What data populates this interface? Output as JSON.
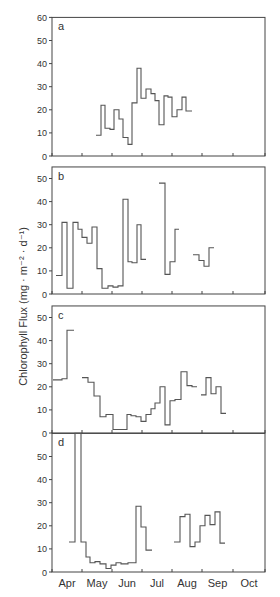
{
  "chart_data": {
    "type": "line",
    "ylabel": "Chlorophyll Flux (mg · m⁻² · d⁻¹)",
    "xlabel": "",
    "x_tick_labels": [
      "Apr",
      "May",
      "Jun",
      "Jul",
      "Aug",
      "Sep",
      "Oct"
    ],
    "x_range_months": [
      "Apr",
      "Oct"
    ],
    "style": "step",
    "panels": [
      {
        "label": "a",
        "ylim": [
          0,
          60
        ],
        "yticks": [
          0,
          10,
          20,
          30,
          40,
          50,
          60
        ],
        "segments": [
          [
            96,
            101,
            9
          ],
          [
            101,
            105,
            22
          ],
          [
            105,
            110,
            12
          ],
          [
            110,
            114,
            11.5
          ],
          [
            114,
            119,
            20
          ],
          [
            119,
            123,
            16
          ],
          [
            123,
            128,
            8
          ],
          [
            128,
            132,
            5
          ],
          [
            132,
            137,
            23
          ],
          [
            137,
            141,
            38
          ],
          [
            141,
            146,
            25
          ],
          [
            146,
            151,
            29
          ],
          [
            151,
            155,
            27
          ],
          [
            155,
            159,
            24
          ],
          [
            159,
            164,
            13.5
          ],
          [
            164,
            168,
            26
          ],
          [
            168,
            172,
            25.5
          ],
          [
            172,
            177,
            17
          ],
          [
            177,
            182,
            20
          ],
          [
            182,
            186,
            25.5
          ],
          [
            186,
            192,
            19.5
          ]
        ]
      },
      {
        "label": "b",
        "ylim": [
          0,
          55
        ],
        "yticks": [
          0,
          10,
          20,
          30,
          40,
          50
        ],
        "segments": [
          [
            56,
            62,
            8
          ],
          [
            62,
            67,
            31
          ],
          [
            67,
            73,
            2.5
          ],
          [
            73,
            78,
            31
          ],
          [
            78,
            82,
            28
          ],
          [
            82,
            87,
            24.5
          ],
          [
            87,
            92,
            22
          ],
          [
            92,
            97,
            29
          ],
          [
            97,
            102,
            11
          ],
          [
            102,
            108,
            2.5
          ],
          [
            108,
            113,
            3.5
          ],
          [
            113,
            118,
            3
          ],
          [
            118,
            123,
            3.5
          ],
          [
            123,
            128,
            41
          ],
          [
            128,
            132,
            14
          ],
          [
            132,
            137,
            13.5
          ],
          [
            137,
            141,
            30
          ],
          [
            141,
            146,
            15
          ],
          null,
          [
            159,
            165,
            48
          ],
          [
            165,
            170,
            8.5
          ],
          [
            170,
            175,
            14
          ],
          [
            175,
            179,
            28
          ],
          null,
          [
            193,
            199,
            17
          ],
          [
            199,
            204,
            14.5
          ],
          [
            204,
            209,
            12
          ],
          [
            209,
            214,
            20
          ]
        ]
      },
      {
        "label": "c",
        "ylim": [
          0,
          55
        ],
        "yticks": [
          0,
          10,
          20,
          30,
          40,
          50
        ],
        "segments": [
          [
            53,
            62,
            23
          ],
          [
            62,
            67,
            23.5
          ],
          [
            67,
            74,
            44.5
          ],
          null,
          [
            82,
            88,
            24
          ],
          [
            88,
            94,
            22
          ],
          [
            94,
            100,
            16
          ],
          [
            100,
            106,
            7
          ],
          [
            106,
            113,
            8
          ],
          [
            113,
            119,
            1.5
          ],
          [
            119,
            127,
            1.5
          ],
          [
            127,
            131,
            8
          ],
          [
            131,
            136,
            7.5
          ],
          [
            136,
            141,
            7
          ],
          [
            141,
            146,
            5
          ],
          [
            146,
            151,
            8
          ],
          [
            151,
            155,
            10.5
          ],
          [
            155,
            160,
            13
          ],
          [
            160,
            165,
            20
          ],
          [
            165,
            170,
            3.5
          ],
          [
            170,
            175,
            14
          ],
          [
            175,
            181,
            14.5
          ],
          [
            181,
            187,
            26.5
          ],
          [
            187,
            192,
            20.5
          ],
          [
            192,
            197,
            20
          ],
          null,
          [
            201,
            206,
            16.5
          ],
          [
            206,
            211,
            24
          ],
          [
            211,
            216,
            17
          ],
          [
            216,
            221,
            20
          ],
          [
            221,
            226,
            8.5
          ]
        ]
      },
      {
        "label": "d",
        "ylim": [
          0,
          60
        ],
        "yticks": [
          0,
          10,
          20,
          30,
          40,
          50
        ],
        "segments": [
          [
            69,
            75,
            13
          ],
          [
            75,
            81,
            60
          ],
          [
            81,
            86,
            13
          ],
          [
            86,
            90,
            6.5
          ],
          [
            90,
            95,
            4
          ],
          [
            95,
            100,
            4.5
          ],
          [
            100,
            106,
            3.5
          ],
          [
            106,
            111,
            1.5
          ],
          [
            111,
            116,
            3
          ],
          [
            116,
            121,
            4
          ],
          [
            121,
            128,
            3.5
          ],
          [
            128,
            136,
            4
          ],
          [
            136,
            141,
            28.5
          ],
          [
            141,
            146,
            19.5
          ],
          [
            146,
            152,
            9.5
          ],
          null,
          [
            174,
            180,
            13
          ],
          [
            180,
            185,
            24
          ],
          [
            185,
            190,
            25
          ],
          [
            190,
            195,
            11
          ],
          [
            195,
            200,
            13
          ],
          [
            200,
            205,
            20
          ],
          [
            205,
            210,
            24.5
          ],
          [
            210,
            215,
            20.5
          ],
          [
            215,
            220,
            26
          ],
          [
            220,
            225,
            12.5
          ]
        ]
      }
    ],
    "legend": null
  }
}
